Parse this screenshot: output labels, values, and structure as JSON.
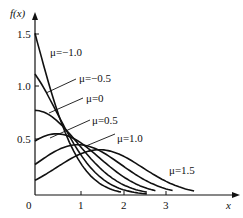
{
  "chart_data": {
    "type": "line",
    "title": "",
    "xlabel": "x",
    "ylabel": "f(x)",
    "xlim": [
      0,
      4.5
    ],
    "ylim": [
      0,
      1.6
    ],
    "x_ticks": [
      "0",
      "1",
      "2",
      "3"
    ],
    "y_ticks": [
      "0.5",
      "1.0",
      "1.5"
    ],
    "grid": false,
    "legend": "inline labels",
    "series": [
      {
        "name": "μ=−1.0",
        "mu": -1.0,
        "x_end": 2.0,
        "f0": 1.5
      },
      {
        "name": "μ=−0.5",
        "mu": -0.5,
        "x_end": 2.6,
        "f0": 1.0
      },
      {
        "name": "μ=0",
        "mu": 0.0,
        "x_end": 2.6,
        "f0": 0.8
      },
      {
        "name": "μ=0.5",
        "mu": 0.5,
        "x_end": 2.8,
        "f0": 0.5
      },
      {
        "name": "μ=1.0",
        "mu": 1.0,
        "x_end": 3.2,
        "f0": 0.29
      },
      {
        "name": "μ=1.5",
        "mu": 1.5,
        "x_end": 3.7,
        "f0": 0.14
      }
    ]
  },
  "labels": {
    "yaxis": "f(x)",
    "xaxis": "x",
    "origin": "0",
    "x1": "1",
    "x2": "2",
    "x3": "3",
    "y05": "0.5",
    "y10": "1.0",
    "y15": "1.5",
    "mu_m10": "μ=−1.0",
    "mu_m05": "μ=−0.5",
    "mu_0": "μ=0",
    "mu_05": "μ=0.5",
    "mu_10": "μ=1.0",
    "mu_15": "μ=1.5"
  }
}
